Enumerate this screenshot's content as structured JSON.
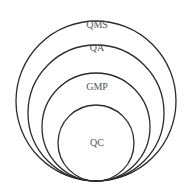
{
  "diagram": {
    "type": "nested-circles",
    "levels": [
      {
        "label": "QMS"
      },
      {
        "label": "QA"
      },
      {
        "label": "GMP"
      },
      {
        "label": "QC"
      }
    ]
  }
}
